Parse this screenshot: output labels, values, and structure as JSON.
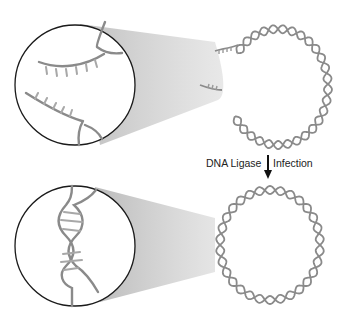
{
  "diagram": {
    "type": "process",
    "colors": {
      "strand": "#8a8a8a",
      "strand_light": "#b0b0b0",
      "magnifier_outline": "#1a1a1a",
      "magnifier_cone": "#c8c8c8",
      "arrow": "#111111"
    },
    "top_panel": {
      "name": "nicked-circular-dna",
      "zoom_detail": "sticky-ends-unpaired"
    },
    "transition": {
      "left_label": "DNA Ligase",
      "right_label": "Infection",
      "arrow": "down-arrow"
    },
    "bottom_panel": {
      "name": "closed-circular-dna",
      "zoom_detail": "ligated-double-helix"
    }
  }
}
